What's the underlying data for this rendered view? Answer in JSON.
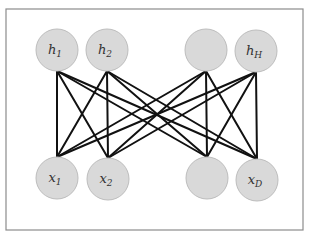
{
  "diagram": {
    "title": "",
    "type": "bipartite-network",
    "frame": {
      "x": 6,
      "y": 9,
      "width": 297,
      "height": 221,
      "stroke": "#8c8c8c"
    },
    "colors": {
      "node_fill": "#d9d9d9",
      "node_stroke": "#bdbdbd",
      "edge": "#111111",
      "text": "#333333"
    },
    "node_radius": 21,
    "hidden_layer": [
      {
        "id": "h1",
        "symbol": "h",
        "sub": "1",
        "cx": 57,
        "cy": 50
      },
      {
        "id": "h2",
        "symbol": "h",
        "sub": "2",
        "cx": 107,
        "cy": 50
      },
      {
        "id": "h3",
        "symbol": "",
        "sub": "",
        "cx": 206,
        "cy": 50
      },
      {
        "id": "hH",
        "symbol": "h",
        "sub": "H",
        "cx": 256,
        "cy": 51
      }
    ],
    "visible_layer": [
      {
        "id": "x1",
        "symbol": "x",
        "sub": "1",
        "cx": 57,
        "cy": 178
      },
      {
        "id": "x2",
        "symbol": "x",
        "sub": "2",
        "cx": 108,
        "cy": 179
      },
      {
        "id": "x3",
        "symbol": "",
        "sub": "",
        "cx": 207,
        "cy": 178
      },
      {
        "id": "xD",
        "symbol": "x",
        "sub": "D",
        "cx": 257,
        "cy": 180
      }
    ],
    "edges": "all hidden-to-visible pairs (fully connected, 16 edges)"
  }
}
